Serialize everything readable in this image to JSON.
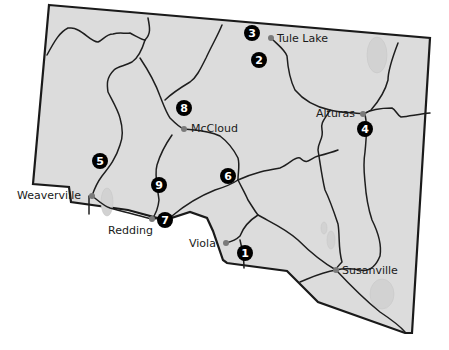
{
  "map": {
    "colors": {
      "land": "#dcdcdc",
      "border": "#1a1a1a",
      "road": "#1e1e1e",
      "town_dot": "#7a7a7a",
      "marker": "#000000"
    },
    "towns": [
      {
        "name": "Tule Lake",
        "x": 271,
        "y": 38
      },
      {
        "name": "Alturas",
        "x": 363,
        "y": 114
      },
      {
        "name": "McCloud",
        "x": 184,
        "y": 129
      },
      {
        "name": "Weaverville",
        "x": 92,
        "y": 196
      },
      {
        "name": "Redding",
        "x": 152,
        "y": 219
      },
      {
        "name": "Viola",
        "x": 226,
        "y": 243
      },
      {
        "name": "Susanville",
        "x": 336,
        "y": 270
      }
    ],
    "markers": [
      {
        "number": "1",
        "x": 245,
        "y": 253
      },
      {
        "number": "2",
        "x": 259,
        "y": 60
      },
      {
        "number": "3",
        "x": 252,
        "y": 33
      },
      {
        "number": "4",
        "x": 365,
        "y": 129
      },
      {
        "number": "5",
        "x": 100,
        "y": 161
      },
      {
        "number": "6",
        "x": 228,
        "y": 176
      },
      {
        "number": "7",
        "x": 165,
        "y": 220
      },
      {
        "number": "8",
        "x": 184,
        "y": 108
      },
      {
        "number": "9",
        "x": 159,
        "y": 185
      }
    ]
  }
}
